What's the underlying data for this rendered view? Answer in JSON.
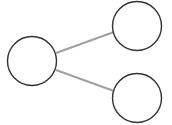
{
  "diagram": {
    "type": "tree",
    "background": "#ffffff",
    "node_stroke": "#333333",
    "node_fill": "#ffffff",
    "edge_color": "#a0a0a0",
    "nodes": [
      {
        "id": "root",
        "cx": 32,
        "cy": 61,
        "r": 24.5
      },
      {
        "id": "child-top",
        "cx": 137,
        "cy": 26,
        "r": 24.5
      },
      {
        "id": "child-bottom",
        "cx": 137,
        "cy": 98,
        "r": 24.5
      }
    ],
    "edges": [
      {
        "from": "root",
        "to": "child-top",
        "x1": 56,
        "y1": 53,
        "x2": 114,
        "y2": 32
      },
      {
        "from": "root",
        "to": "child-bottom",
        "x1": 56,
        "y1": 70,
        "x2": 114,
        "y2": 91
      }
    ]
  }
}
